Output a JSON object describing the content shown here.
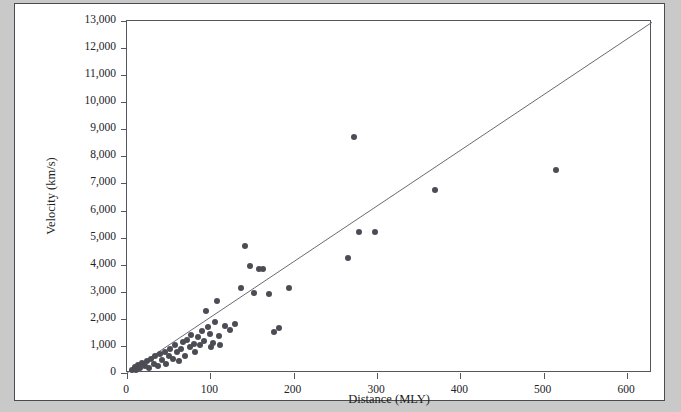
{
  "figure": {
    "background_color": "#c9c9c9",
    "card_color": "#ffffff",
    "border_color": "#4b4b52",
    "point_color": "#4c4c55",
    "line_color": "#6a6a72"
  },
  "chart_data": {
    "type": "scatter",
    "title": "",
    "xlabel": "Distance (MLY)",
    "ylabel": "Velocity (km/s)",
    "xlim": [
      0,
      630
    ],
    "ylim": [
      0,
      13000
    ],
    "xticks": [
      0,
      100,
      200,
      300,
      400,
      500,
      600
    ],
    "xtick_labels": [
      "0",
      "100",
      "200",
      "300",
      "400",
      "500",
      "600"
    ],
    "yticks": [
      0,
      1000,
      2000,
      3000,
      4000,
      5000,
      6000,
      7000,
      8000,
      9000,
      10000,
      11000,
      12000,
      13000
    ],
    "ytick_labels": [
      "0",
      "1,000",
      "2,000",
      "3,000",
      "4,000",
      "5,000",
      "6,000",
      "7,000",
      "8,000",
      "9,000",
      "10,000",
      "11,000",
      "12,000",
      "13,000"
    ],
    "grid": false,
    "legend": null,
    "trend_line": {
      "type": "line",
      "x": [
        0,
        630
      ],
      "y": [
        0,
        12950
      ],
      "slope_km_s_per_mly": 20.6
    },
    "points": [
      [
        6,
        120
      ],
      [
        9,
        210
      ],
      [
        11,
        100
      ],
      [
        13,
        300
      ],
      [
        15,
        180
      ],
      [
        18,
        360
      ],
      [
        21,
        250
      ],
      [
        24,
        430
      ],
      [
        26,
        180
      ],
      [
        29,
        520
      ],
      [
        32,
        330
      ],
      [
        34,
        620
      ],
      [
        37,
        250
      ],
      [
        39,
        700
      ],
      [
        42,
        470
      ],
      [
        45,
        790
      ],
      [
        47,
        340
      ],
      [
        50,
        640
      ],
      [
        52,
        900
      ],
      [
        55,
        520
      ],
      [
        57,
        1020
      ],
      [
        60,
        760
      ],
      [
        62,
        430
      ],
      [
        65,
        880
      ],
      [
        67,
        1150
      ],
      [
        70,
        640
      ],
      [
        72,
        1230
      ],
      [
        75,
        950
      ],
      [
        77,
        1400
      ],
      [
        80,
        1080
      ],
      [
        82,
        760
      ],
      [
        85,
        1320
      ],
      [
        87,
        1050
      ],
      [
        90,
        1550
      ],
      [
        92,
        1180
      ],
      [
        95,
        2300
      ],
      [
        97,
        1700
      ],
      [
        99,
        1450
      ],
      [
        101,
        960
      ],
      [
        103,
        1100
      ],
      [
        106,
        1900
      ],
      [
        108,
        2650
      ],
      [
        110,
        1350
      ],
      [
        112,
        1050
      ],
      [
        118,
        1750
      ],
      [
        124,
        1600
      ],
      [
        130,
        1800
      ],
      [
        137,
        3150
      ],
      [
        142,
        4700
      ],
      [
        148,
        3950
      ],
      [
        152,
        2950
      ],
      [
        158,
        3850
      ],
      [
        163,
        3850
      ],
      [
        170,
        2900
      ],
      [
        176,
        1500
      ],
      [
        182,
        1650
      ],
      [
        194,
        3150
      ],
      [
        265,
        4250
      ],
      [
        272,
        8700
      ],
      [
        278,
        5200
      ],
      [
        298,
        5200
      ],
      [
        370,
        6750
      ],
      [
        515,
        7500
      ]
    ]
  }
}
